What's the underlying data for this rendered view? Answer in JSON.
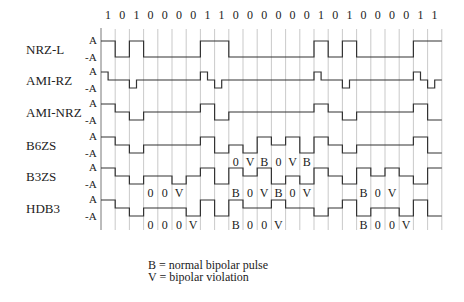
{
  "diagram": {
    "bits": [
      "1",
      "0",
      "1",
      "0",
      "0",
      "0",
      "0",
      "1",
      "1",
      "0",
      "0",
      "0",
      "0",
      "0",
      "0",
      "1",
      "0",
      "1",
      "0",
      "0",
      "0",
      "0",
      "1",
      "1"
    ],
    "amplitude_labels": {
      "pos": "A",
      "neg": "-A"
    },
    "rows": [
      {
        "name": "NRZ-L",
        "levels": [
          1,
          -1,
          1,
          -1,
          -1,
          -1,
          -1,
          1,
          1,
          -1,
          -1,
          -1,
          -1,
          -1,
          -1,
          1,
          -1,
          1,
          -1,
          -1,
          -1,
          -1,
          1,
          1
        ],
        "type": "nrz"
      },
      {
        "name": "AMI-RZ",
        "levels": [
          1,
          0,
          -1,
          0,
          0,
          0,
          0,
          1,
          -1,
          0,
          0,
          0,
          0,
          0,
          0,
          1,
          0,
          -1,
          0,
          0,
          0,
          0,
          1,
          -1
        ],
        "type": "rz"
      },
      {
        "name": "AMI-NRZ",
        "levels": [
          1,
          0,
          -1,
          0,
          0,
          0,
          0,
          1,
          -1,
          0,
          0,
          0,
          0,
          0,
          0,
          1,
          0,
          -1,
          0,
          0,
          0,
          0,
          1,
          -1
        ],
        "type": "nrz"
      },
      {
        "name": "B6ZS",
        "levels": [
          1,
          0,
          -1,
          0,
          0,
          0,
          0,
          1,
          -1,
          0,
          -1,
          1,
          0,
          1,
          -1,
          1,
          0,
          -1,
          0,
          0,
          0,
          0,
          1,
          -1
        ],
        "type": "nrz"
      },
      {
        "name": "B3ZS",
        "levels": [
          1,
          0,
          -1,
          0,
          0,
          -1,
          0,
          1,
          -1,
          1,
          0,
          1,
          -1,
          0,
          -1,
          1,
          0,
          -1,
          1,
          0,
          1,
          0,
          -1,
          1
        ],
        "type": "nrz"
      },
      {
        "name": "HDB3",
        "levels": [
          1,
          0,
          -1,
          0,
          0,
          0,
          -1,
          1,
          -1,
          1,
          0,
          0,
          1,
          0,
          0,
          -1,
          0,
          1,
          -1,
          0,
          0,
          -1,
          1,
          -1
        ],
        "type": "nrz"
      }
    ],
    "annotations": [
      {
        "row": 3,
        "labels": [
          {
            "bit": 9,
            "text": "0"
          },
          {
            "bit": 10,
            "text": "V"
          },
          {
            "bit": 11,
            "text": "B"
          },
          {
            "bit": 12,
            "text": "0"
          },
          {
            "bit": 13,
            "text": "V"
          },
          {
            "bit": 14,
            "text": "B"
          }
        ]
      },
      {
        "row": 4,
        "labels": [
          {
            "bit": 3,
            "text": "0"
          },
          {
            "bit": 4,
            "text": "0"
          },
          {
            "bit": 5,
            "text": "V"
          },
          {
            "bit": 9,
            "text": "B"
          },
          {
            "bit": 10,
            "text": "0"
          },
          {
            "bit": 11,
            "text": "V"
          },
          {
            "bit": 12,
            "text": "B"
          },
          {
            "bit": 13,
            "text": "0"
          },
          {
            "bit": 14,
            "text": "V"
          },
          {
            "bit": 18,
            "text": "B"
          },
          {
            "bit": 19,
            "text": "0"
          },
          {
            "bit": 20,
            "text": "V"
          }
        ]
      },
      {
        "row": 5,
        "labels": [
          {
            "bit": 3,
            "text": "0"
          },
          {
            "bit": 4,
            "text": "0"
          },
          {
            "bit": 5,
            "text": "0"
          },
          {
            "bit": 6,
            "text": "V"
          },
          {
            "bit": 9,
            "text": "B"
          },
          {
            "bit": 10,
            "text": "0"
          },
          {
            "bit": 11,
            "text": "0"
          },
          {
            "bit": 12,
            "text": "V"
          },
          {
            "bit": 18,
            "text": "B"
          },
          {
            "bit": 19,
            "text": "0"
          },
          {
            "bit": 20,
            "text": "0"
          },
          {
            "bit": 21,
            "text": "V"
          }
        ]
      }
    ],
    "legend": {
      "b": "B = normal bipolar pulse",
      "v": "V = bipolar violation"
    }
  }
}
